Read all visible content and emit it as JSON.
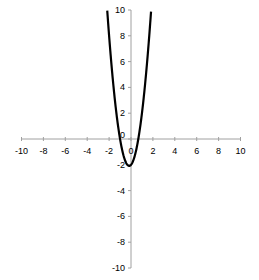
{
  "chart_data": {
    "type": "line",
    "title": "",
    "xlabel": "",
    "ylabel": "",
    "xlim": [
      -10,
      10
    ],
    "ylim": [
      -10,
      10
    ],
    "grid": false,
    "legend": null,
    "x_ticks": [
      -10,
      -8,
      -6,
      -4,
      -2,
      0,
      2,
      4,
      6,
      8,
      10
    ],
    "y_ticks": [
      -10,
      -8,
      -6,
      -4,
      -2,
      0,
      2,
      4,
      6,
      8,
      10
    ],
    "series": [
      {
        "name": "y = 3x^2 + x - 2",
        "color": "#000000",
        "x": [
          -2.17,
          -2.0,
          -1.75,
          -1.5,
          -1.25,
          -1.0,
          -0.75,
          -0.5,
          -0.25,
          -0.167,
          0.0,
          0.25,
          0.5,
          0.667,
          0.75,
          1.0,
          1.25,
          1.5,
          1.75,
          1.84
        ],
        "y": [
          10.0,
          8.0,
          5.44,
          3.25,
          1.44,
          0.0,
          -1.06,
          -1.75,
          -2.06,
          -2.08,
          -2.0,
          -1.56,
          -0.75,
          0.0,
          0.44,
          2.0,
          3.94,
          6.25,
          8.94,
          10.0
        ]
      }
    ],
    "axis_color": "#a0a0a0",
    "line_color": "#000000"
  }
}
